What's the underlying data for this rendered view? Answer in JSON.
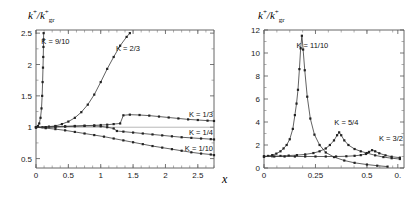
{
  "figure": {
    "panels": [
      {
        "id": "left-panel",
        "ylabel": "k+/k+gr",
        "xlabel": "x",
        "xticks": [
          "0",
          "0.5",
          "1",
          "1.5",
          "2",
          "2.5"
        ],
        "yticks": [
          "0.5",
          "1",
          "1.5",
          "2",
          "2.5"
        ],
        "curve_labels": [
          "K = 9/10",
          "K = 2/3",
          "K = 1/3",
          "K = 1/4",
          "K = 1/10"
        ]
      },
      {
        "id": "right-panel",
        "ylabel": "k+/k+gr",
        "xlabel": "",
        "xticks": [
          "0",
          "0.25",
          "0.5",
          "0."
        ],
        "yticks": [
          "0",
          "2",
          "4",
          "6",
          "8",
          "10",
          "12"
        ],
        "curve_labels": [
          "K = 11/10",
          "K = 5/4",
          "K = 3/2"
        ]
      }
    ]
  },
  "chart_data": [
    {
      "type": "line",
      "id": "left-panel",
      "title": "",
      "xlabel": "x",
      "ylabel": "k+/k+gr",
      "xlim": [
        0,
        2.75
      ],
      "ylim": [
        0.35,
        2.55
      ],
      "xticks": [
        0,
        0.5,
        1,
        1.5,
        2,
        2.5
      ],
      "yticks": [
        0.5,
        1,
        1.5,
        2,
        2.5
      ],
      "grid": false,
      "legend": "inline-annotations",
      "reference_line_y": 1.0,
      "series": [
        {
          "name": "K = 9/10",
          "label_x": 0.3,
          "label_y": 2.33,
          "x": [
            0.0,
            0.03,
            0.05,
            0.07,
            0.085,
            0.095,
            0.102,
            0.108,
            0.112,
            0.115,
            0.117,
            0.118
          ],
          "y": [
            1.0,
            1.02,
            1.06,
            1.15,
            1.3,
            1.5,
            1.72,
            1.95,
            2.12,
            2.28,
            2.4,
            2.5
          ]
        },
        {
          "name": "K = 2/3",
          "label_x": 1.42,
          "label_y": 2.22,
          "x": [
            0.0,
            0.1,
            0.2,
            0.3,
            0.4,
            0.5,
            0.6,
            0.7,
            0.8,
            0.9,
            1.0,
            1.1,
            1.2,
            1.3,
            1.4,
            1.45
          ],
          "y": [
            1.0,
            1.0,
            1.01,
            1.02,
            1.05,
            1.09,
            1.15,
            1.24,
            1.36,
            1.52,
            1.72,
            1.93,
            2.12,
            2.3,
            2.44,
            2.5
          ]
        },
        {
          "name": "K = 1/3",
          "label_x": 2.62,
          "label_y": 1.17,
          "x": [
            0.0,
            0.15,
            0.3,
            0.45,
            0.6,
            0.75,
            0.9,
            1.0,
            1.1,
            1.2,
            1.3,
            1.35,
            1.45,
            1.6,
            1.75,
            1.9,
            2.05,
            2.2,
            2.35,
            2.5,
            2.65,
            2.75
          ],
          "y": [
            1.0,
            1.0,
            1.01,
            1.015,
            1.02,
            1.025,
            1.03,
            1.035,
            1.04,
            1.05,
            1.06,
            1.19,
            1.2,
            1.195,
            1.185,
            1.17,
            1.155,
            1.14,
            1.125,
            1.115,
            1.105,
            1.1
          ]
        },
        {
          "name": "K = 1/4",
          "label_x": 2.62,
          "label_y": 0.87,
          "x": [
            0.0,
            0.15,
            0.3,
            0.45,
            0.6,
            0.75,
            0.9,
            1.0,
            1.1,
            1.2,
            1.25,
            1.35,
            1.5,
            1.65,
            1.8,
            1.95,
            2.1,
            2.25,
            2.4,
            2.55,
            2.7,
            2.75
          ],
          "y": [
            1.0,
            1.0,
            1.005,
            1.01,
            1.015,
            1.02,
            1.02,
            1.015,
            1.0,
            0.98,
            0.94,
            0.93,
            0.915,
            0.9,
            0.885,
            0.87,
            0.855,
            0.84,
            0.83,
            0.82,
            0.81,
            0.805
          ]
        },
        {
          "name": "K = 1/10",
          "label_x": 2.62,
          "label_y": 0.62,
          "x": [
            0.0,
            0.15,
            0.3,
            0.45,
            0.6,
            0.75,
            0.9,
            1.05,
            1.2,
            1.35,
            1.5,
            1.65,
            1.8,
            1.95,
            2.1,
            2.25,
            2.4,
            2.55,
            2.7,
            2.75
          ],
          "y": [
            1.0,
            0.985,
            0.97,
            0.95,
            0.925,
            0.9,
            0.875,
            0.85,
            0.82,
            0.79,
            0.76,
            0.73,
            0.7,
            0.675,
            0.65,
            0.625,
            0.6,
            0.58,
            0.565,
            0.555
          ]
        }
      ]
    },
    {
      "type": "line",
      "id": "right-panel",
      "title": "",
      "xlabel": "",
      "ylabel": "k+/k+gr",
      "xlim": [
        0,
        0.68
      ],
      "ylim": [
        0,
        12
      ],
      "xticks": [
        0,
        0.25,
        0.5,
        0.65
      ],
      "yticks": [
        0,
        2,
        4,
        6,
        8,
        10,
        12
      ],
      "grid": false,
      "legend": "inline-annotations",
      "series": [
        {
          "name": "K = 11/10",
          "label_x": 0.235,
          "label_y": 10.4,
          "x": [
            0.0,
            0.02,
            0.04,
            0.06,
            0.08,
            0.095,
            0.11,
            0.125,
            0.14,
            0.15,
            0.158,
            0.165,
            0.172,
            0.178,
            0.184,
            0.19,
            0.198,
            0.21,
            0.225,
            0.245,
            0.27,
            0.3,
            0.34,
            0.39,
            0.44,
            0.5,
            0.55,
            0.6
          ],
          "y": [
            1.0,
            1.05,
            1.12,
            1.25,
            1.45,
            1.7,
            2.0,
            2.5,
            3.4,
            4.6,
            5.6,
            6.8,
            8.6,
            10.4,
            11.5,
            10.3,
            8.5,
            6.2,
            4.3,
            2.9,
            2.0,
            1.35,
            0.95,
            0.65,
            0.45,
            0.3,
            0.2,
            0.12
          ]
        },
        {
          "name": "K = 5/4",
          "label_x": 0.4,
          "label_y": 3.75,
          "x": [
            0.0,
            0.04,
            0.08,
            0.12,
            0.16,
            0.2,
            0.24,
            0.27,
            0.3,
            0.32,
            0.34,
            0.355,
            0.365,
            0.375,
            0.39,
            0.41,
            0.44,
            0.47,
            0.5,
            0.54,
            0.58,
            0.62,
            0.66
          ],
          "y": [
            1.0,
            1.02,
            1.05,
            1.08,
            1.12,
            1.18,
            1.3,
            1.45,
            1.7,
            2.0,
            2.4,
            2.85,
            3.1,
            2.85,
            2.4,
            2.0,
            1.65,
            1.45,
            1.3,
            1.1,
            0.95,
            0.85,
            0.78
          ]
        },
        {
          "name": "K = 3/2",
          "label_x": 0.585,
          "label_y": 2.35,
          "x": [
            0.0,
            0.05,
            0.1,
            0.15,
            0.2,
            0.25,
            0.3,
            0.35,
            0.4,
            0.44,
            0.47,
            0.495,
            0.51,
            0.525,
            0.54,
            0.56,
            0.59,
            0.62,
            0.66
          ],
          "y": [
            1.0,
            1.0,
            1.0,
            1.0,
            1.0,
            1.0,
            1.0,
            1.0,
            1.02,
            1.06,
            1.12,
            1.22,
            1.4,
            1.55,
            1.45,
            1.28,
            1.1,
            0.98,
            0.9
          ]
        }
      ]
    }
  ]
}
